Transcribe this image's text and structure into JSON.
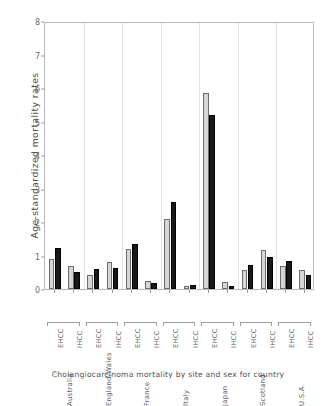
{
  "caption": "Cholangiocarcinoma mortality by site and sex for country",
  "axis": {
    "ylabel": "Age-standardized mortality rates",
    "yticks": [
      "0",
      "1",
      "2",
      "3",
      "4",
      "5",
      "6",
      "7",
      "8"
    ]
  },
  "colors": {
    "series_light": "#d6d6d6",
    "series_dark": "#191919",
    "grid": "#e2e2e2",
    "axis": "#b9b9b9",
    "text": "#5d5d5d"
  },
  "site_labels": [
    "EHCC",
    "IHCC",
    "EHCC",
    "IHCC",
    "EHCC",
    "IHCC",
    "EHCC",
    "IHCC",
    "EHCC",
    "IHCC",
    "EHCC",
    "IHCC",
    "EHCC",
    "IHCC"
  ],
  "country_labels": [
    "Australia",
    "England/Wales",
    "France",
    "Italy",
    "Japan",
    "Scotland",
    "U.S.A."
  ],
  "chart_data": {
    "type": "bar",
    "title": "",
    "subtitle": "",
    "xlabel": "Cholangiocarcinoma mortality by site and sex for country",
    "ylabel": "Age-standardized mortality rates",
    "ylim": [
      0,
      8
    ],
    "ytick_values": [
      0,
      1,
      2,
      3,
      4,
      5,
      6,
      7,
      8
    ],
    "grid": "vertical-group-separators",
    "legend": "none",
    "countries": [
      "Australia",
      "England/Wales",
      "France",
      "Italy",
      "Japan",
      "Scotland",
      "U.S.A."
    ],
    "sites": [
      "EHCC",
      "IHCC"
    ],
    "series": [
      {
        "name": "light",
        "values": [
          0.9,
          0.68,
          0.42,
          0.8,
          1.2,
          0.25,
          2.1,
          0.1,
          5.85,
          0.2,
          0.58,
          1.15,
          0.68,
          0.57
        ]
      },
      {
        "name": "dark",
        "values": [
          1.22,
          0.52,
          0.59,
          0.62,
          1.35,
          0.18,
          2.6,
          0.12,
          5.2,
          0.08,
          0.72,
          0.97,
          0.85,
          0.41
        ]
      }
    ],
    "groups": [
      {
        "country": "Australia",
        "site": "EHCC",
        "light": 0.9,
        "dark": 1.22
      },
      {
        "country": "Australia",
        "site": "IHCC",
        "light": 0.68,
        "dark": 0.52
      },
      {
        "country": "England/Wales",
        "site": "EHCC",
        "light": 0.42,
        "dark": 0.59
      },
      {
        "country": "England/Wales",
        "site": "IHCC",
        "light": 0.8,
        "dark": 0.62
      },
      {
        "country": "France",
        "site": "EHCC",
        "light": 1.2,
        "dark": 1.35
      },
      {
        "country": "France",
        "site": "IHCC",
        "light": 0.25,
        "dark": 0.18
      },
      {
        "country": "Italy",
        "site": "EHCC",
        "light": 2.1,
        "dark": 2.6
      },
      {
        "country": "Italy",
        "site": "IHCC",
        "light": 0.1,
        "dark": 0.12
      },
      {
        "country": "Japan",
        "site": "EHCC",
        "light": 5.85,
        "dark": 5.2
      },
      {
        "country": "Japan",
        "site": "IHCC",
        "light": 0.2,
        "dark": 0.08
      },
      {
        "country": "Scotland",
        "site": "EHCC",
        "light": 0.58,
        "dark": 0.72
      },
      {
        "country": "Scotland",
        "site": "IHCC",
        "light": 1.15,
        "dark": 0.97
      },
      {
        "country": "U.S.A.",
        "site": "EHCC",
        "light": 0.68,
        "dark": 0.85
      },
      {
        "country": "U.S.A.",
        "site": "IHCC",
        "light": 0.57,
        "dark": 0.41
      }
    ]
  }
}
